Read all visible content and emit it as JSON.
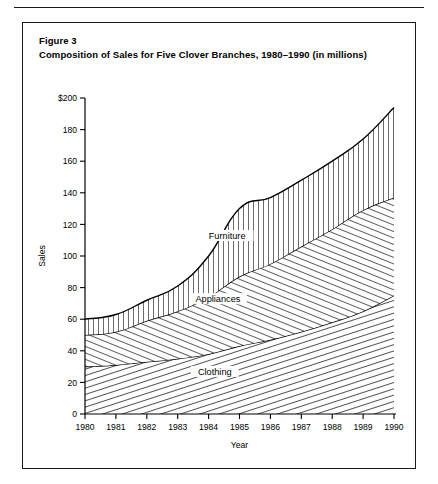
{
  "figure": {
    "caption_line1": "Figure 3",
    "caption_line2": "Composition of Sales for Five Clover Branches, 1980–1990 (in millions)"
  },
  "chart_data": {
    "type": "area",
    "title": "Composition of Sales for Five Clover Branches, 1980–1990 (in millions)",
    "stacked": true,
    "xlabel": "Year",
    "ylabel": "Sales",
    "x": [
      1980,
      1981,
      1982,
      1983,
      1984,
      1985,
      1986,
      1987,
      1988,
      1989,
      1990
    ],
    "categories": [
      "1980",
      "1981",
      "1982",
      "1983",
      "1984",
      "1985",
      "1986",
      "1987",
      "1988",
      "1989",
      "1990"
    ],
    "xlim": [
      1980,
      1990
    ],
    "ylim": [
      0,
      200
    ],
    "yticks": [
      0,
      20,
      40,
      60,
      80,
      100,
      120,
      140,
      160,
      180,
      200
    ],
    "ytick_labels": [
      "0",
      "20",
      "40",
      "60",
      "80",
      "100",
      "120",
      "140",
      "160",
      "180",
      "$200"
    ],
    "grid": false,
    "legend": "inline-labels",
    "series": [
      {
        "name": "Clothing",
        "fill": "diagonal-steep-hatch",
        "values": [
          30,
          31,
          33,
          35,
          38,
          43,
          47,
          52,
          58,
          65,
          75
        ],
        "label_position": "inside"
      },
      {
        "name": "Appliances",
        "fill": "diagonal-shallow-hatch",
        "values": [
          20,
          21,
          26,
          30,
          36,
          44,
          48,
          54,
          59,
          64,
          62
        ],
        "label_position": "inside",
        "cumulative_top": [
          50,
          52,
          59,
          65,
          74,
          87,
          95,
          106,
          117,
          129,
          137
        ]
      },
      {
        "name": "Furniture",
        "fill": "vertical-line-hatch",
        "values": [
          10,
          11,
          13,
          16,
          26,
          43,
          42,
          42,
          43,
          45,
          57
        ],
        "label_position": "inside",
        "cumulative_top": [
          60,
          63,
          72,
          81,
          100,
          130,
          137,
          148,
          160,
          174,
          194
        ]
      }
    ],
    "totals": [
      60,
      63,
      72,
      81,
      100,
      130,
      137,
      148,
      160,
      174,
      194
    ],
    "annotations": [
      {
        "text": "Furniture",
        "x": 1984.6,
        "y": 112
      },
      {
        "text": "Appliances",
        "x": 1984.3,
        "y": 72
      },
      {
        "text": "Clothing",
        "x": 1984.2,
        "y": 26
      }
    ],
    "colors": {
      "line": "#000000",
      "background": "#ffffff",
      "hatch": "#1a1a1a"
    }
  }
}
